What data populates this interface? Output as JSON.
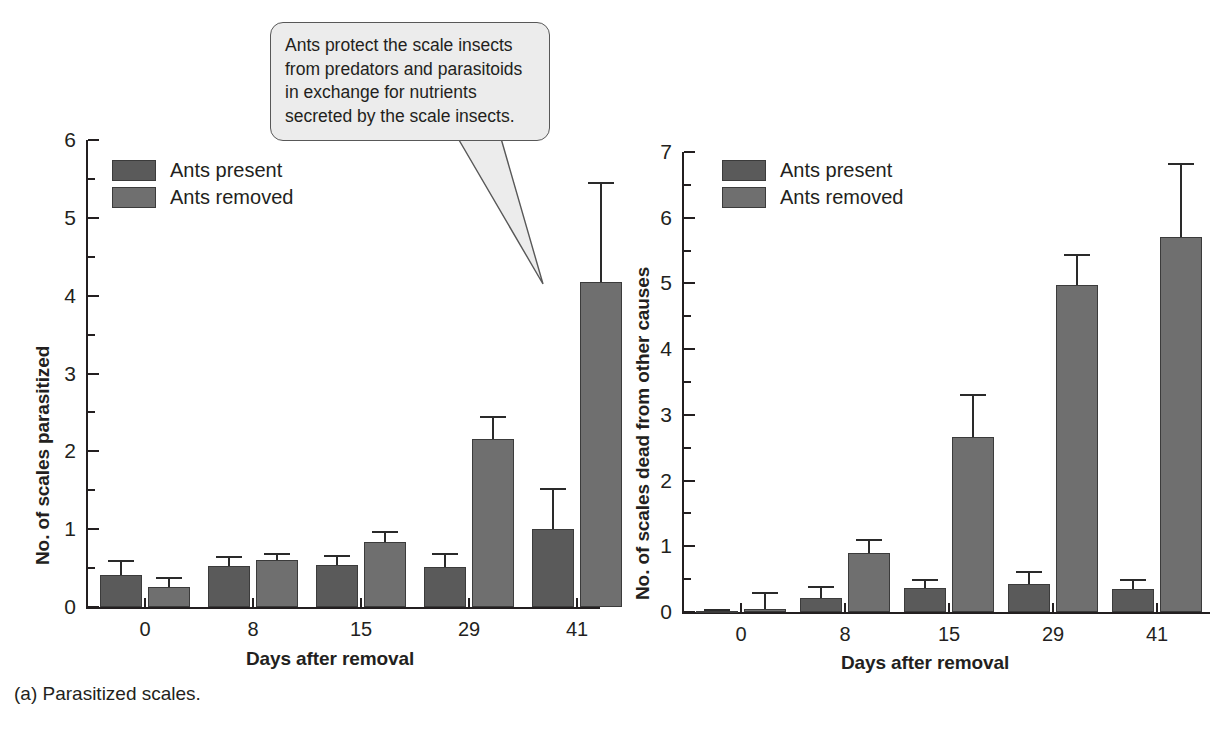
{
  "callout": {
    "lines": [
      "Ants protect the scale insects",
      "from predators and parasitoids",
      "in exchange for nutrients",
      "secreted by the scale insects."
    ]
  },
  "legend": {
    "present_label": "Ants present",
    "removed_label": "Ants removed",
    "present_color": "#5a5a5a",
    "removed_color": "#6f6f6f"
  },
  "captions": {
    "a": "(a) Parasitized scales.",
    "b": "(b) Scales dead from other causes."
  },
  "inset": {
    "name": "scale-insect-photo"
  },
  "chart_data": [
    {
      "id": "panel-a",
      "type": "bar",
      "title": "(a) Parasitized scales.",
      "xlabel": "Days after removal",
      "ylabel": "No. of scales parasitized",
      "categories": [
        "0",
        "8",
        "15",
        "29",
        "41"
      ],
      "ylim": [
        0,
        6
      ],
      "yticks": [
        0,
        1,
        2,
        3,
        4,
        5,
        6
      ],
      "grid": false,
      "legend_position": "top-left",
      "series": [
        {
          "name": "Ants present",
          "color": "#5a5a5a",
          "values": [
            0.41,
            0.53,
            0.54,
            0.52,
            1.0
          ],
          "errors": [
            0.19,
            0.12,
            0.13,
            0.17,
            0.53
          ]
        },
        {
          "name": "Ants removed",
          "color": "#6f6f6f",
          "values": [
            0.26,
            0.6,
            0.84,
            2.16,
            4.17
          ],
          "errors": [
            0.12,
            0.1,
            0.14,
            0.29,
            1.29
          ]
        }
      ]
    },
    {
      "id": "panel-b",
      "type": "bar",
      "title": "(b) Scales dead from other causes.",
      "xlabel": "Days after removal",
      "ylabel": "No. of scales dead from other causes",
      "categories": [
        "0",
        "8",
        "15",
        "29",
        "41"
      ],
      "ylim": [
        0,
        7
      ],
      "yticks": [
        0,
        1,
        2,
        3,
        4,
        5,
        6,
        7
      ],
      "grid": false,
      "legend_position": "top-left",
      "series": [
        {
          "name": "Ants present",
          "color": "#5a5a5a",
          "values": [
            0.02,
            0.21,
            0.36,
            0.43,
            0.35
          ],
          "errors": [
            0.02,
            0.19,
            0.14,
            0.19,
            0.15
          ]
        },
        {
          "name": "Ants removed",
          "color": "#6f6f6f",
          "values": [
            0.04,
            0.9,
            2.67,
            4.98,
            5.71
          ],
          "errors": [
            0.27,
            0.21,
            0.64,
            0.47,
            1.12
          ]
        }
      ]
    }
  ]
}
